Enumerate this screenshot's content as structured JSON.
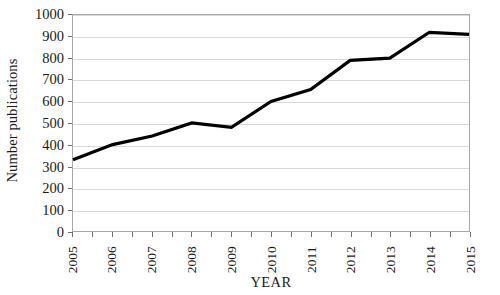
{
  "chart_data": {
    "type": "line",
    "title": "",
    "xlabel": "YEAR",
    "ylabel": "Number publications",
    "categories": [
      "2005",
      "2006",
      "2007",
      "2008",
      "2009",
      "2010",
      "2011",
      "2012",
      "2013",
      "2014",
      "2015"
    ],
    "values": [
      330,
      400,
      440,
      500,
      480,
      600,
      655,
      790,
      800,
      920,
      910
    ],
    "series": [
      {
        "name": "Number publications",
        "values": [
          330,
          400,
          440,
          500,
          480,
          600,
          655,
          790,
          800,
          920,
          910
        ]
      }
    ],
    "ylim": [
      0,
      1000
    ],
    "y_ticks": [
      0,
      100,
      200,
      300,
      400,
      500,
      600,
      700,
      800,
      900,
      1000
    ],
    "y_tick_labels": [
      "0",
      "100",
      "200",
      "300",
      "400",
      "500",
      "600",
      "700",
      "800",
      "900",
      "1000"
    ],
    "grid": true,
    "grid_axis": "y",
    "legend": false,
    "legend_position": "none",
    "line_color": "#000000",
    "line_width": 3.2,
    "grid_color": "#d9d9d9",
    "axis_color": "#a8a8a8",
    "background_color": "#ffffff",
    "x_tick_label_rotation": -90
  }
}
